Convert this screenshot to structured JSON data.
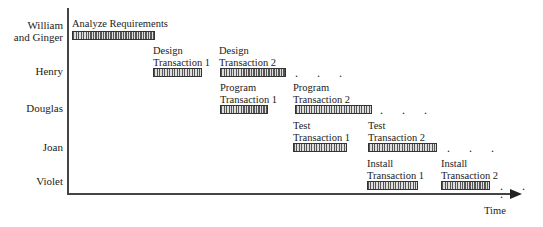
{
  "people": [
    {
      "name": "William and Ginger",
      "line1": "William",
      "line2": "and Ginger"
    },
    {
      "name": "Henry"
    },
    {
      "name": "Douglas"
    },
    {
      "name": "Joan"
    },
    {
      "name": "Violet"
    }
  ],
  "tasks": [
    {
      "line1": "Analyze Requirements",
      "line2": ""
    },
    {
      "line1": "Design",
      "line2": "Transaction 1"
    },
    {
      "line1": "Design",
      "line2": "Transaction 2"
    },
    {
      "line1": "Program",
      "line2": "Transaction 1"
    },
    {
      "line1": "Program",
      "line2": "Transaction 2"
    },
    {
      "line1": "Test",
      "line2": "Transaction 1"
    },
    {
      "line1": "Test",
      "line2": "Transaction 2"
    },
    {
      "line1": "Install",
      "line2": "Transaction 1"
    },
    {
      "line1": "Install",
      "line2": "Transaction 2"
    }
  ],
  "continuation": ". . .",
  "axis": {
    "x_label": "Time"
  }
}
